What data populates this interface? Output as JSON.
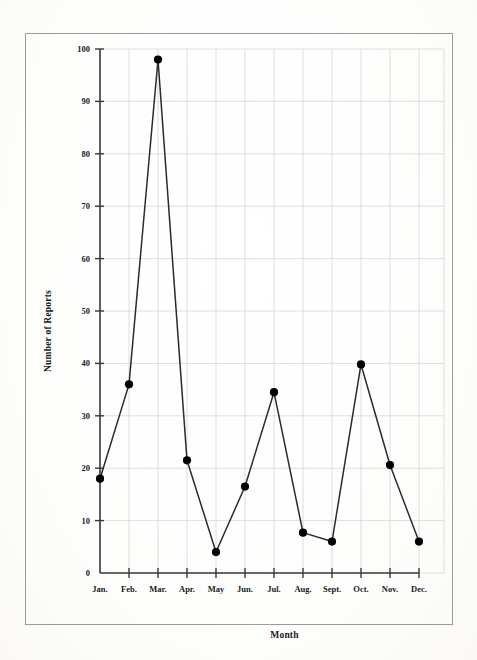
{
  "figure": {
    "background_color": "#fefefe",
    "border_color": "#9a9a9a",
    "ink_color": "#1a1a1a",
    "grid_color": "#d6d6d6"
  },
  "chart_data": {
    "type": "line",
    "title": "",
    "xlabel": "Month",
    "ylabel": "Number of Reports",
    "categories": [
      "Jan.",
      "Feb.",
      "Mar.",
      "Apr.",
      "May",
      "Jun.",
      "Jul.",
      "Aug.",
      "Sept.",
      "Oct.",
      "Nov.",
      "Dec."
    ],
    "values": [
      18,
      36,
      98,
      21.5,
      4,
      16.5,
      34.5,
      7.7,
      6,
      39.8,
      20.6,
      6
    ],
    "series": [
      {
        "name": "Number of Reports",
        "values": [
          18,
          36,
          98,
          21.5,
          4,
          16.5,
          34.5,
          7.7,
          6,
          39.8,
          20.6,
          6
        ]
      }
    ],
    "ylim": [
      0,
      100
    ],
    "yticks": [
      0,
      10,
      20,
      30,
      40,
      50,
      60,
      70,
      80,
      90,
      100
    ],
    "ytick_labels": [
      "0",
      "10",
      "20",
      "30",
      "40",
      "50",
      "60",
      "70",
      "80",
      "90",
      "100"
    ],
    "grid": true,
    "grid_axes": "both",
    "legend": false,
    "legend_position": "none",
    "marker": "filled-circle",
    "marker_color": "#000000",
    "line_color": "#2b2b2b"
  }
}
